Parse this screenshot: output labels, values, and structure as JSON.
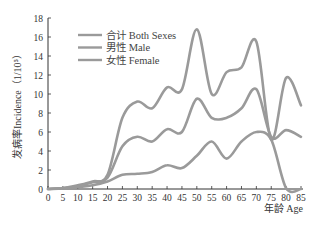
{
  "chart_data": {
    "type": "line",
    "title": "",
    "xlabel": "年龄 Age",
    "ylabel": "发病率Incidence（1/10⁵）",
    "x": [
      0,
      5,
      10,
      15,
      20,
      25,
      30,
      35,
      40,
      45,
      50,
      55,
      60,
      65,
      70,
      75,
      80,
      85
    ],
    "x_ticks": [
      "0",
      "5",
      "10",
      "15",
      "20",
      "25",
      "30",
      "35",
      "40",
      "45",
      "50",
      "55",
      "60",
      "65",
      "70",
      "75",
      "80",
      "85"
    ],
    "y_ticks": [
      "0",
      "2",
      "4",
      "6",
      "8",
      "10",
      "12",
      "14",
      "16",
      "18"
    ],
    "xlim": [
      0,
      85
    ],
    "ylim": [
      0,
      18
    ],
    "grid": false,
    "legend_position": "upper-left",
    "series": [
      {
        "name": "合计 Both Sexes",
        "values": [
          0,
          0.1,
          0.4,
          0.8,
          1.5,
          7.5,
          9.2,
          8.5,
          10.7,
          10.5,
          16.8,
          10.0,
          12.3,
          12.8,
          15.5,
          5.2,
          11.7,
          8.8
        ]
      },
      {
        "name": "男性 Male",
        "values": [
          0,
          0.05,
          0.2,
          0.4,
          0.8,
          1.5,
          1.6,
          1.8,
          2.5,
          2.2,
          3.5,
          5.0,
          3.2,
          5.0,
          6.0,
          5.2,
          0.1,
          0
        ]
      },
      {
        "name": "女性 Female",
        "values": [
          0,
          0.1,
          0.3,
          0.7,
          1.2,
          4.5,
          5.5,
          5.0,
          6.3,
          6.0,
          9.5,
          7.5,
          7.5,
          8.5,
          10.5,
          5.5,
          6.2,
          5.5
        ]
      }
    ]
  },
  "legend": {
    "items": [
      {
        "label": "合计 Both Sexes"
      },
      {
        "label": "男性 Male"
      },
      {
        "label": "女性 Female"
      }
    ]
  },
  "axes": {
    "x_title": "年龄 Age",
    "y_title": "发病率Incidence（1/10⁵）"
  },
  "colors": {
    "line": "#9a9a9a",
    "axis": "#333333"
  }
}
